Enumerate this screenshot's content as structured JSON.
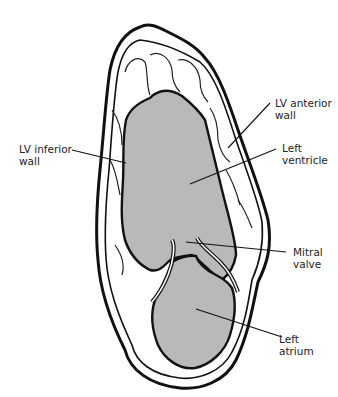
{
  "diagram": {
    "colors": {
      "cavity_fill": "#b9b9b9",
      "outline": "#111111",
      "background": "#ffffff",
      "wall_fill": "#ffffff"
    },
    "labels": [
      {
        "id": "lv-anterior-wall",
        "line1": "LV anterior",
        "line2": "wall"
      },
      {
        "id": "lv-inferior-wall",
        "line1": "LV inferior",
        "line2": "wall"
      },
      {
        "id": "left-ventricle",
        "line1": "Left",
        "line2": "ventricle"
      },
      {
        "id": "mitral-valve",
        "line1": "Mitral",
        "line2": "valve"
      },
      {
        "id": "left-atrium",
        "line1": "Left",
        "line2": "atrium"
      }
    ]
  }
}
